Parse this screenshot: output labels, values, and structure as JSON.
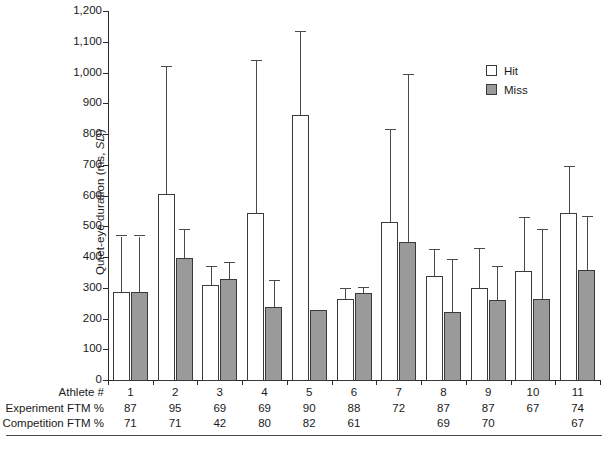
{
  "chart_data": {
    "type": "bar",
    "title": "",
    "xlabel": "Athlete #",
    "ylabel": "Quiet-eye duration (ms, SD)",
    "ylim": [
      0,
      1200
    ],
    "ytick_labels": [
      "0",
      "100",
      "200",
      "300",
      "400",
      "500",
      "600",
      "700",
      "800",
      "900",
      "1,000",
      "1,100",
      "1,200"
    ],
    "ytick_values": [
      0,
      100,
      200,
      300,
      400,
      500,
      600,
      700,
      800,
      900,
      1000,
      1100,
      1200
    ],
    "grid": false,
    "legend_position": "top-right",
    "categories": [
      "1",
      "2",
      "3",
      "4",
      "5",
      "6",
      "7",
      "8",
      "9",
      "10",
      "11"
    ],
    "series": [
      {
        "name": "Hit",
        "color": "#ffffff",
        "values": [
          288,
          608,
          313,
          548,
          865,
          268,
          518,
          342,
          303,
          358,
          545
        ],
        "error_high": [
          470,
          1020,
          372,
          1040,
          1135,
          300,
          815,
          425,
          430,
          530,
          695
        ]
      },
      {
        "name": "Miss",
        "color": "#9a9a9a",
        "values": [
          288,
          400,
          332,
          242,
          230,
          285,
          452,
          225,
          265,
          267,
          362
        ],
        "error_high": [
          470,
          490,
          385,
          325,
          230,
          302,
          995,
          395,
          370,
          492,
          535
        ]
      }
    ]
  },
  "legend": {
    "items": [
      {
        "label": "Hit",
        "swatch": "hit"
      },
      {
        "label": "Miss",
        "swatch": "miss"
      }
    ]
  },
  "table": {
    "rows": [
      {
        "label": "Athlete #",
        "values": [
          "1",
          "2",
          "3",
          "4",
          "5",
          "6",
          "7",
          "8",
          "9",
          "10",
          "11"
        ]
      },
      {
        "label": "Experiment FTM %",
        "values": [
          "87",
          "95",
          "69",
          "69",
          "90",
          "88",
          "72",
          "87",
          "87",
          "67",
          "74"
        ]
      },
      {
        "label": "Competition FTM %",
        "values": [
          "71",
          "71",
          "42",
          "80",
          "82",
          "61",
          "",
          "69",
          "70",
          "",
          "67"
        ]
      }
    ]
  },
  "axis": {
    "y_title_main": "Quiet-eye duration (ms, ",
    "y_title_italic": "SD",
    "y_title_end": ")"
  }
}
